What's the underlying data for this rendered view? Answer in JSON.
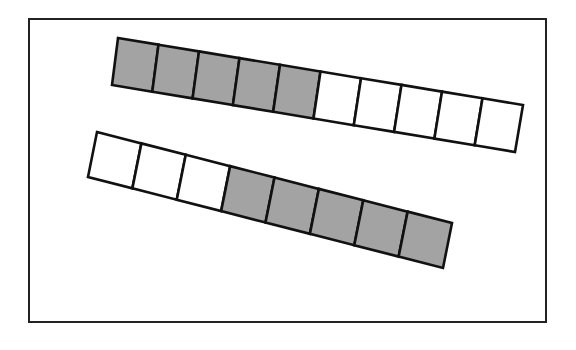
{
  "figure": {
    "frame": {
      "x": 29,
      "y": 19,
      "width": 517,
      "height": 303
    },
    "colors": {
      "shaded": "#a3a3a3",
      "unshaded": "#ffffff",
      "stroke": "#111111"
    },
    "strips": [
      {
        "name": "top-strip",
        "cells": 10,
        "shaded_indices": [
          0,
          1,
          2,
          3,
          4
        ],
        "corners": {
          "tl": [
            118,
            38
          ],
          "tr": [
            523,
            105
          ],
          "br": [
            515,
            152
          ],
          "bl": [
            112,
            85
          ]
        }
      },
      {
        "name": "bottom-strip",
        "cells": 8,
        "shaded_indices": [
          3,
          4,
          5,
          6,
          7
        ],
        "corners": {
          "tl": [
            97,
            132
          ],
          "tr": [
            452,
            223
          ],
          "br": [
            443,
            268
          ],
          "bl": [
            88,
            177
          ]
        }
      }
    ]
  }
}
